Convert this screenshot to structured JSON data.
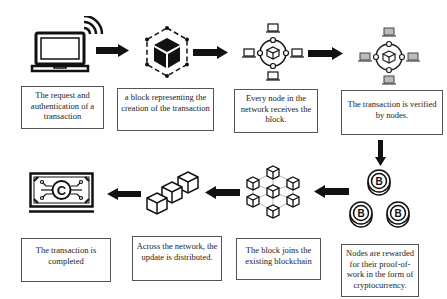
{
  "diagram": {
    "steps": [
      {
        "id": 1,
        "label": "The request and authentication of a transaction",
        "icon": "laptop-wifi-icon"
      },
      {
        "id": 2,
        "label": "a block representing the creation of the transaction",
        "icon": "hexagon-block-icon"
      },
      {
        "id": 3,
        "label": "Every node in the network receives the block.",
        "icon": "network-nodes-icon"
      },
      {
        "id": 4,
        "label": "The transaction is verified by nodes.",
        "icon": "verified-nodes-icon"
      },
      {
        "id": 5,
        "label": "Nodes are rewarded for their proof-of-work in the form of cryptocurrency.",
        "icon": "bitcoin-coins-icon"
      },
      {
        "id": 6,
        "label": "The block joins the existing blockchain",
        "icon": "blockchain-network-icon"
      },
      {
        "id": 7,
        "label": "Across the network, the update is distributed.",
        "icon": "chained-cubes-icon"
      },
      {
        "id": 8,
        "label": "The transaction is completed",
        "icon": "crypto-banknote-icon"
      }
    ],
    "flow": [
      "1→2",
      "2→3",
      "3→4",
      "4→5",
      "5→6",
      "6→7",
      "7→8"
    ],
    "colors": {
      "stroke": "#111111",
      "box_border": "#555555",
      "background": "#ffffff"
    }
  }
}
